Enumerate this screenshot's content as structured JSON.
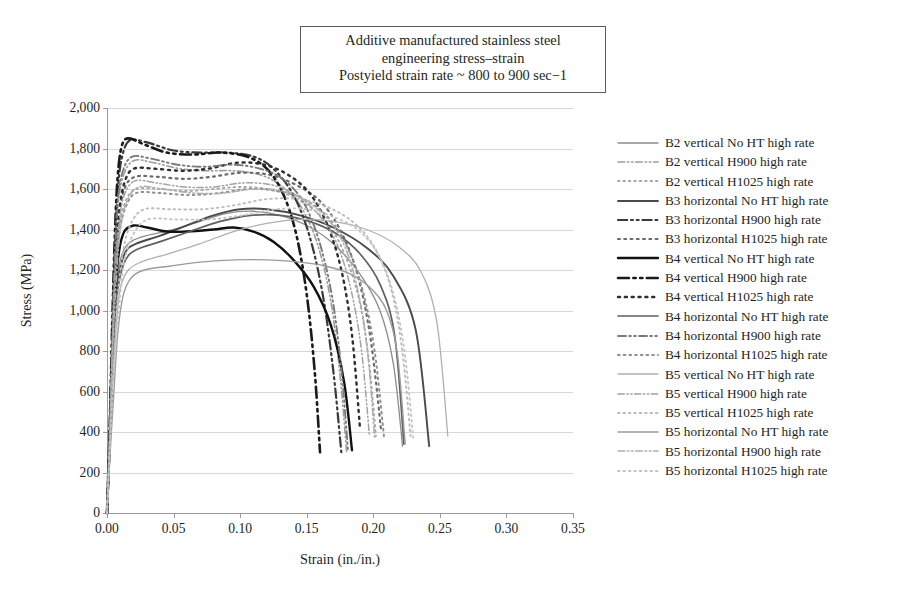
{
  "title": {
    "line1": "Additive manufactured stainless steel",
    "line2": "engineering stress–strain",
    "line3": "Postyield strain rate ~ 800 to 900 sec−1"
  },
  "axes": {
    "xlabel": "Strain (in./in.)",
    "ylabel": "Stress (MPa)",
    "xticks": [
      "0.00",
      "0.05",
      "0.10",
      "0.15",
      "0.20",
      "0.25",
      "0.30",
      "0.35"
    ],
    "yticks": [
      "2,000",
      "1,800",
      "1,600",
      "1,400",
      "1,200",
      "1,000",
      "800",
      "600",
      "400",
      "200",
      "0"
    ]
  },
  "chart_data": {
    "type": "line",
    "xlabel": "Strain (in./in.)",
    "ylabel": "Stress (MPa)",
    "xlim": [
      0.0,
      0.35
    ],
    "ylim": [
      0,
      2000
    ],
    "xticks": [
      0.0,
      0.05,
      0.1,
      0.15,
      0.2,
      0.25,
      0.3,
      0.35
    ],
    "yticks": [
      0,
      200,
      400,
      600,
      800,
      1000,
      1200,
      1400,
      1600,
      1800,
      2000
    ],
    "grid": "horizontal",
    "legend_position": "right",
    "series": [
      {
        "name": "B2 vertical No HT high rate",
        "style": "solid",
        "color": "#8c8c8c",
        "width": 1.3,
        "x": [
          0.0,
          0.002,
          0.004,
          0.006,
          0.008,
          0.012,
          0.018,
          0.03,
          0.05,
          0.07,
          0.09,
          0.11,
          0.13,
          0.15,
          0.17,
          0.19,
          0.205,
          0.215,
          0.222
        ],
        "y": [
          0,
          330,
          700,
          1010,
          1180,
          1290,
          1340,
          1370,
          1400,
          1440,
          1480,
          1490,
          1470,
          1420,
          1330,
          1180,
          1000,
          740,
          330
        ]
      },
      {
        "name": "B2 vertical H900 high rate",
        "style": "dashdot",
        "color": "#9d9d9d",
        "width": 1.6,
        "x": [
          0.0,
          0.002,
          0.004,
          0.006,
          0.008,
          0.012,
          0.02,
          0.035,
          0.055,
          0.075,
          0.095,
          0.115,
          0.13,
          0.145,
          0.158,
          0.168,
          0.175,
          0.18
        ],
        "y": [
          0,
          380,
          850,
          1250,
          1500,
          1660,
          1740,
          1730,
          1700,
          1690,
          1690,
          1670,
          1620,
          1520,
          1330,
          1050,
          680,
          300
        ]
      },
      {
        "name": "B2 vertical H1025 high rate",
        "style": "dotted",
        "color": "#a8a8a8",
        "width": 1.9,
        "x": [
          0.0,
          0.002,
          0.004,
          0.006,
          0.009,
          0.014,
          0.022,
          0.04,
          0.06,
          0.08,
          0.1,
          0.12,
          0.14,
          0.16,
          0.175,
          0.188,
          0.196,
          0.202
        ],
        "y": [
          0,
          350,
          790,
          1160,
          1400,
          1540,
          1600,
          1600,
          1590,
          1600,
          1610,
          1600,
          1560,
          1470,
          1330,
          1090,
          790,
          380
        ]
      },
      {
        "name": "B3 horizontal No HT high rate",
        "style": "solid",
        "color": "#4a4a4a",
        "width": 1.9,
        "x": [
          0.0,
          0.002,
          0.004,
          0.006,
          0.009,
          0.014,
          0.022,
          0.04,
          0.06,
          0.08,
          0.1,
          0.12,
          0.145,
          0.17,
          0.195,
          0.215,
          0.232,
          0.242
        ],
        "y": [
          0,
          320,
          690,
          1000,
          1180,
          1290,
          1330,
          1370,
          1420,
          1470,
          1500,
          1500,
          1470,
          1410,
          1310,
          1170,
          900,
          330
        ]
      },
      {
        "name": "B3 horizontal H900 high rate",
        "style": "dashdot",
        "color": "#3a3a3a",
        "width": 2.2,
        "x": [
          0.0,
          0.002,
          0.004,
          0.006,
          0.008,
          0.011,
          0.017,
          0.03,
          0.05,
          0.07,
          0.09,
          0.11,
          0.125,
          0.14,
          0.152,
          0.162,
          0.17,
          0.176
        ],
        "y": [
          0,
          400,
          900,
          1320,
          1580,
          1750,
          1840,
          1830,
          1790,
          1780,
          1780,
          1760,
          1700,
          1570,
          1370,
          1080,
          700,
          300
        ]
      },
      {
        "name": "B3 horizontal H1025 high rate",
        "style": "dotted",
        "color": "#6b6b6b",
        "width": 2.2,
        "x": [
          0.0,
          0.002,
          0.004,
          0.006,
          0.009,
          0.013,
          0.021,
          0.038,
          0.058,
          0.078,
          0.1,
          0.122,
          0.142,
          0.16,
          0.175,
          0.188,
          0.198,
          0.206
        ],
        "y": [
          0,
          360,
          820,
          1200,
          1450,
          1600,
          1660,
          1660,
          1650,
          1660,
          1680,
          1670,
          1620,
          1540,
          1400,
          1180,
          860,
          400
        ]
      },
      {
        "name": "B4 vertical No HT high rate",
        "style": "solid",
        "color": "#111111",
        "width": 2.4,
        "x": [
          0.0,
          0.002,
          0.004,
          0.006,
          0.009,
          0.013,
          0.02,
          0.03,
          0.045,
          0.06,
          0.08,
          0.095,
          0.11,
          0.125,
          0.14,
          0.155,
          0.168,
          0.178,
          0.184
        ],
        "y": [
          0,
          340,
          740,
          1080,
          1290,
          1390,
          1420,
          1410,
          1390,
          1390,
          1400,
          1410,
          1390,
          1340,
          1250,
          1120,
          930,
          650,
          310
        ]
      },
      {
        "name": "B4 vertical H900 high rate",
        "style": "dashdot",
        "color": "#1a1a1a",
        "width": 2.6,
        "x": [
          0.0,
          0.002,
          0.004,
          0.006,
          0.008,
          0.011,
          0.016,
          0.028,
          0.045,
          0.065,
          0.085,
          0.105,
          0.12,
          0.132,
          0.142,
          0.15,
          0.156,
          0.16
        ],
        "y": [
          0,
          420,
          950,
          1390,
          1660,
          1810,
          1850,
          1820,
          1780,
          1770,
          1780,
          1760,
          1700,
          1580,
          1380,
          1080,
          700,
          300
        ]
      },
      {
        "name": "B4 vertical H1025 high rate",
        "style": "dotted",
        "color": "#2e2e2e",
        "width": 2.4,
        "x": [
          0.0,
          0.002,
          0.004,
          0.006,
          0.009,
          0.013,
          0.02,
          0.036,
          0.056,
          0.076,
          0.098,
          0.118,
          0.136,
          0.152,
          0.165,
          0.176,
          0.184,
          0.19
        ],
        "y": [
          0,
          370,
          840,
          1230,
          1480,
          1630,
          1700,
          1700,
          1690,
          1700,
          1730,
          1720,
          1670,
          1580,
          1430,
          1200,
          880,
          420
        ]
      },
      {
        "name": "B4 horizontal No HT high rate",
        "style": "solid",
        "color": "#5f5f5f",
        "width": 1.7,
        "x": [
          0.0,
          0.002,
          0.004,
          0.006,
          0.009,
          0.014,
          0.022,
          0.04,
          0.062,
          0.085,
          0.108,
          0.13,
          0.152,
          0.172,
          0.19,
          0.205,
          0.216,
          0.223
        ],
        "y": [
          0,
          300,
          660,
          960,
          1140,
          1250,
          1300,
          1340,
          1390,
          1440,
          1470,
          1470,
          1440,
          1380,
          1280,
          1130,
          880,
          340
        ]
      },
      {
        "name": "B4 horizontal H900 high rate",
        "style": "dashdot",
        "color": "#7a7a7a",
        "width": 1.9,
        "x": [
          0.0,
          0.002,
          0.004,
          0.006,
          0.008,
          0.012,
          0.019,
          0.033,
          0.053,
          0.073,
          0.095,
          0.115,
          0.132,
          0.147,
          0.159,
          0.169,
          0.176,
          0.181
        ],
        "y": [
          0,
          390,
          880,
          1290,
          1540,
          1690,
          1760,
          1750,
          1720,
          1710,
          1720,
          1700,
          1650,
          1540,
          1350,
          1070,
          710,
          310
        ]
      },
      {
        "name": "B4 horizontal H1025 high rate",
        "style": "dotted",
        "color": "#909090",
        "width": 2.0,
        "x": [
          0.0,
          0.002,
          0.004,
          0.006,
          0.009,
          0.014,
          0.022,
          0.04,
          0.062,
          0.084,
          0.106,
          0.128,
          0.148,
          0.166,
          0.18,
          0.192,
          0.201,
          0.208
        ],
        "y": [
          0,
          340,
          770,
          1130,
          1370,
          1510,
          1580,
          1580,
          1570,
          1580,
          1600,
          1590,
          1550,
          1460,
          1320,
          1100,
          800,
          380
        ]
      },
      {
        "name": "B5 vertical No HT high rate",
        "style": "solid",
        "color": "#b0b0b0",
        "width": 1.3,
        "x": [
          0.0,
          0.002,
          0.004,
          0.007,
          0.01,
          0.016,
          0.026,
          0.046,
          0.07,
          0.095,
          0.12,
          0.145,
          0.17,
          0.195,
          0.218,
          0.236,
          0.248,
          0.256
        ],
        "y": [
          0,
          280,
          620,
          930,
          1110,
          1200,
          1240,
          1280,
          1330,
          1390,
          1430,
          1450,
          1440,
          1400,
          1320,
          1190,
          930,
          380
        ]
      },
      {
        "name": "B5 vertical H900 high rate",
        "style": "dashdot",
        "color": "#a3a3a3",
        "width": 1.5,
        "x": [
          0.0,
          0.002,
          0.004,
          0.006,
          0.009,
          0.013,
          0.021,
          0.037,
          0.058,
          0.08,
          0.102,
          0.124,
          0.142,
          0.158,
          0.172,
          0.183,
          0.191,
          0.197
        ],
        "y": [
          0,
          360,
          810,
          1190,
          1430,
          1570,
          1640,
          1630,
          1610,
          1610,
          1630,
          1620,
          1570,
          1480,
          1340,
          1110,
          810,
          390
        ]
      },
      {
        "name": "B5 vertical H1025 high rate",
        "style": "dotted",
        "color": "#bcbcbc",
        "width": 1.9,
        "x": [
          0.0,
          0.002,
          0.005,
          0.008,
          0.012,
          0.018,
          0.028,
          0.048,
          0.072,
          0.096,
          0.12,
          0.144,
          0.166,
          0.186,
          0.202,
          0.214,
          0.222,
          0.228
        ],
        "y": [
          0,
          320,
          720,
          1060,
          1290,
          1430,
          1500,
          1500,
          1500,
          1520,
          1550,
          1550,
          1510,
          1430,
          1300,
          1090,
          790,
          380
        ]
      },
      {
        "name": "B5 horizontal No HT high rate",
        "style": "solid",
        "color": "#9b9b9b",
        "width": 1.4,
        "x": [
          0.0,
          0.002,
          0.005,
          0.008,
          0.012,
          0.018,
          0.028,
          0.048,
          0.072,
          0.096,
          0.12,
          0.143,
          0.164,
          0.183,
          0.198,
          0.21,
          0.218,
          0.224
        ],
        "y": [
          0,
          260,
          580,
          880,
          1070,
          1160,
          1200,
          1220,
          1240,
          1250,
          1250,
          1240,
          1220,
          1180,
          1110,
          1000,
          790,
          340
        ]
      },
      {
        "name": "B5 horizontal H900 high rate",
        "style": "dashdot",
        "color": "#aeaeae",
        "width": 1.6,
        "x": [
          0.0,
          0.002,
          0.004,
          0.007,
          0.01,
          0.015,
          0.024,
          0.042,
          0.065,
          0.088,
          0.11,
          0.132,
          0.15,
          0.166,
          0.179,
          0.189,
          0.196,
          0.201
        ],
        "y": [
          0,
          350,
          790,
          1160,
          1400,
          1540,
          1610,
          1600,
          1580,
          1580,
          1600,
          1590,
          1540,
          1450,
          1310,
          1080,
          780,
          370
        ]
      },
      {
        "name": "B5 horizontal H1025 high rate",
        "style": "dotted",
        "color": "#c4c4c4",
        "width": 1.9,
        "x": [
          0.0,
          0.002,
          0.005,
          0.009,
          0.013,
          0.02,
          0.031,
          0.052,
          0.077,
          0.102,
          0.127,
          0.15,
          0.171,
          0.19,
          0.205,
          0.216,
          0.224,
          0.23
        ],
        "y": [
          0,
          300,
          680,
          1010,
          1240,
          1380,
          1450,
          1450,
          1450,
          1470,
          1500,
          1500,
          1460,
          1390,
          1260,
          1060,
          770,
          370
        ]
      }
    ]
  },
  "legend": {
    "items": [
      {
        "label": "B2 vertical No HT high rate",
        "style": "solid",
        "color": "#8c8c8c",
        "width": 1.3
      },
      {
        "label": "B2 vertical H900 high rate",
        "style": "dashdot",
        "color": "#9d9d9d",
        "width": 1.6
      },
      {
        "label": "B2 vertical H1025 high rate",
        "style": "dotted",
        "color": "#a8a8a8",
        "width": 1.9
      },
      {
        "label": "B3 horizontal No HT high rate",
        "style": "solid",
        "color": "#4a4a4a",
        "width": 1.9
      },
      {
        "label": "B3 horizontal H900 high rate",
        "style": "dashdot",
        "color": "#3a3a3a",
        "width": 2.2
      },
      {
        "label": "B3 horizontal H1025 high rate",
        "style": "dotted",
        "color": "#6b6b6b",
        "width": 2.2
      },
      {
        "label": "B4 vertical No HT high rate",
        "style": "solid",
        "color": "#111111",
        "width": 2.4
      },
      {
        "label": "B4 vertical H900 high rate",
        "style": "dashdot",
        "color": "#1a1a1a",
        "width": 2.6
      },
      {
        "label": "B4 vertical H1025 high rate",
        "style": "dotted",
        "color": "#2e2e2e",
        "width": 2.4
      },
      {
        "label": "B4 horizontal No HT high rate",
        "style": "solid",
        "color": "#5f5f5f",
        "width": 1.7
      },
      {
        "label": "B4 horizontal H900 high rate",
        "style": "dashdot",
        "color": "#7a7a7a",
        "width": 1.9
      },
      {
        "label": "B4 horizontal H1025 high rate",
        "style": "dotted",
        "color": "#909090",
        "width": 2.0
      },
      {
        "label": "B5 vertical No HT high rate",
        "style": "solid",
        "color": "#b0b0b0",
        "width": 1.3
      },
      {
        "label": "B5 vertical H900 high rate",
        "style": "dashdot",
        "color": "#a3a3a3",
        "width": 1.5
      },
      {
        "label": "B5 vertical H1025 high rate",
        "style": "dotted",
        "color": "#bcbcbc",
        "width": 1.9
      },
      {
        "label": "B5 horizontal No HT high rate",
        "style": "solid",
        "color": "#9b9b9b",
        "width": 1.4
      },
      {
        "label": "B5 horizontal H900 high rate",
        "style": "dashdot",
        "color": "#aeaeae",
        "width": 1.6
      },
      {
        "label": "B5 horizontal H1025 high rate",
        "style": "dotted",
        "color": "#c4c4c4",
        "width": 1.9
      }
    ]
  }
}
